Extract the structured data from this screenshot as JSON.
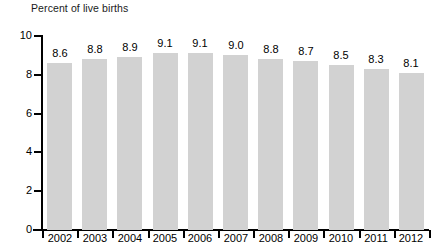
{
  "chart_data": {
    "type": "bar",
    "title": "Percent of live births",
    "subtitle": "",
    "xlabel": "",
    "ylabel": "",
    "categories": [
      "2002",
      "2003",
      "2004",
      "2005",
      "2006",
      "2007",
      "2008",
      "2009",
      "2010",
      "2011",
      "2012"
    ],
    "values": [
      8.6,
      8.8,
      8.9,
      9.1,
      9.1,
      9.0,
      8.8,
      8.7,
      8.5,
      8.3,
      8.1
    ],
    "data_labels": [
      "8.6",
      "8.8",
      "8.9",
      "9.1",
      "9.1",
      "9.0",
      "8.8",
      "8.7",
      "8.5",
      "8.3",
      "8.1"
    ],
    "ylim": [
      0,
      10
    ],
    "ytick_values": [
      0,
      2,
      4,
      6,
      8,
      10
    ],
    "ytick_labels": [
      "0",
      "2",
      "4",
      "6",
      "8",
      "10"
    ],
    "grid": false,
    "legend": null,
    "bar_color": "#d2d2d2",
    "axis_color": "#000000",
    "text_color": "#000000"
  },
  "axis": {
    "y_labels": [
      "10",
      "8",
      "6",
      "4",
      "2",
      "0"
    ]
  }
}
